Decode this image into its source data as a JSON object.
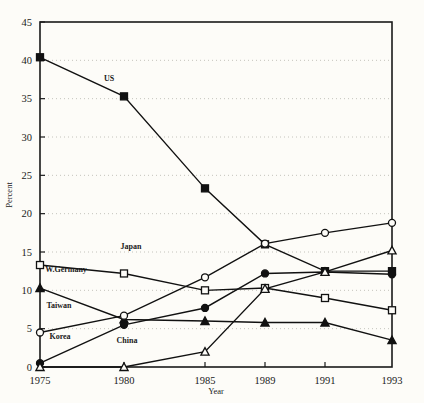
{
  "chart_data": {
    "type": "line",
    "title": "",
    "xlabel": "Year",
    "ylabel": "Percent",
    "x": [
      1975,
      1980,
      1985,
      1989,
      1991,
      1993
    ],
    "xtick_labels": [
      "1975",
      "1980",
      "1985",
      "1989",
      "1991",
      "1993"
    ],
    "ytick_labels": [
      "0",
      "5",
      "10",
      "15",
      "20",
      "25",
      "30",
      "35",
      "40",
      "45"
    ],
    "yticks": [
      0,
      5,
      10,
      15,
      20,
      25,
      30,
      35,
      40,
      45
    ],
    "ylim": [
      0,
      45
    ],
    "grid": "horizontal-dotted",
    "legend": "inline-labels",
    "series": [
      {
        "name": "US",
        "marker": "filled-square",
        "label_text": "US",
        "values": [
          40.4,
          35.3,
          23.3,
          16.0,
          12.5,
          12.5
        ]
      },
      {
        "name": "Japan",
        "marker": "open-square",
        "label_text": "Japan",
        "values": [
          13.3,
          12.2,
          10.0,
          10.3,
          9.0,
          7.4
        ]
      },
      {
        "name": "W.Germany",
        "marker": "filled-triangle",
        "label_text": "W.Germany",
        "values": [
          10.3,
          6.2,
          6.0,
          5.8,
          5.8,
          3.5
        ]
      },
      {
        "name": "Taiwan",
        "marker": "open-circle",
        "label_text": "Taiwan",
        "values": [
          4.5,
          6.7,
          11.7,
          16.1,
          17.5,
          18.8
        ]
      },
      {
        "name": "Korea",
        "marker": "filled-circle",
        "label_text": "Korea",
        "values": [
          0.5,
          5.5,
          7.7,
          12.2,
          12.4,
          12.1
        ]
      },
      {
        "name": "China",
        "marker": "open-triangle",
        "label_text": "China",
        "values": [
          0.0,
          0.0,
          2.0,
          10.2,
          12.4,
          15.2
        ]
      }
    ],
    "colors": {
      "line": "#111111",
      "marker_fill": "#111111",
      "marker_hollow": "#fdfcf8",
      "axis": "#1a1a1a",
      "grid": "#bdbdb5",
      "background": "#fdfcf8"
    }
  }
}
